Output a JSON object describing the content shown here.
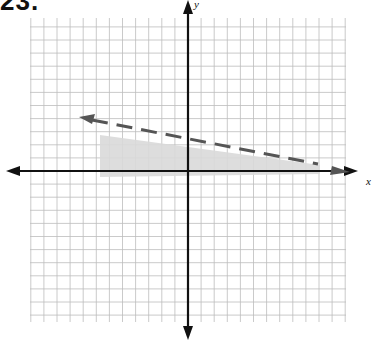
{
  "problem": {
    "number": "23."
  },
  "chart_data": {
    "type": "line",
    "title": "",
    "xlabel": "x",
    "ylabel": "y",
    "grid": true,
    "xlim": [
      -12,
      12
    ],
    "ylim": [
      -12,
      12
    ],
    "boundary_line": {
      "style": "dashed",
      "arrow_left_end": [
        -8,
        4
      ],
      "arrow_right_end": [
        10,
        0.5
      ],
      "approx_equation": "y = -0.2x + 2.4",
      "slope": -0.2,
      "y_intercept": 2.4
    },
    "shaded_region": {
      "description": "below dashed line, above x-axis, for x >= -6.5",
      "x_range": [
        -6.5,
        10
      ],
      "y_range": [
        0,
        4
      ],
      "color": "#d9d9d9"
    },
    "colors": {
      "grid": "#bdbdbd",
      "axes": "#111111",
      "boundary": "#555555",
      "shade": "#d9d9d9"
    }
  }
}
